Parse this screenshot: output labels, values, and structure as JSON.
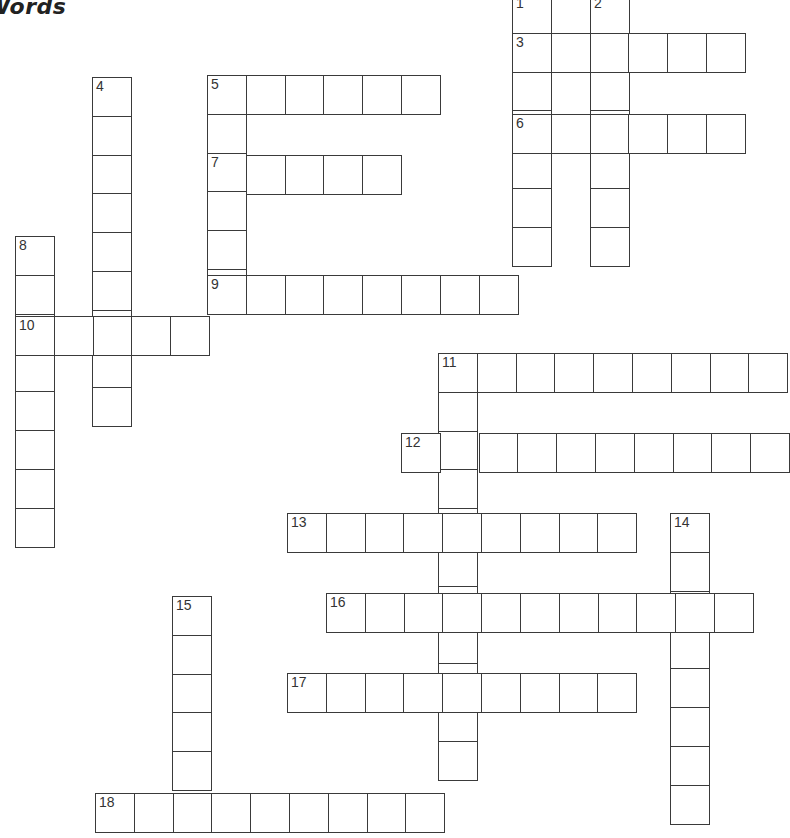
{
  "title": "Words",
  "cell_size": 38.8,
  "colors": {
    "line": "#3a3a3a",
    "background": "#ffffff",
    "number": "#333333"
  },
  "words": [
    {
      "number": 1,
      "direction": "down",
      "x": 512,
      "y": -6,
      "length": 7
    },
    {
      "number": 2,
      "direction": "down",
      "x": 590,
      "y": -6,
      "length": 7
    },
    {
      "number": 3,
      "direction": "across",
      "x": 512,
      "y": 33,
      "length": 6
    },
    {
      "number": 4,
      "direction": "down",
      "x": 92,
      "y": 77,
      "length": 9
    },
    {
      "number": 5,
      "direction": "across",
      "x": 207,
      "y": 75,
      "length": 6
    },
    {
      "number": 5,
      "direction": "down",
      "x": 207,
      "y": 75,
      "length": 6
    },
    {
      "number": 6,
      "direction": "across",
      "x": 512,
      "y": 114,
      "length": 6
    },
    {
      "number": 7,
      "direction": "across",
      "x": 207,
      "y": 155,
      "length": 5
    },
    {
      "number": 8,
      "direction": "down",
      "x": 15,
      "y": 236,
      "length": 8
    },
    {
      "number": 9,
      "direction": "across",
      "x": 207,
      "y": 275,
      "length": 8
    },
    {
      "number": 10,
      "direction": "across",
      "x": 15,
      "y": 316,
      "length": 5
    },
    {
      "number": 11,
      "direction": "across",
      "x": 438,
      "y": 353,
      "length": 9
    },
    {
      "number": 11,
      "direction": "down",
      "x": 438,
      "y": 353,
      "length": 11
    },
    {
      "number": 12,
      "direction": "across",
      "x": 401,
      "y": 433,
      "length": 10
    },
    {
      "number": 13,
      "direction": "across",
      "x": 287,
      "y": 513,
      "length": 9
    },
    {
      "number": 14,
      "direction": "down",
      "x": 670,
      "y": 513,
      "length": 8
    },
    {
      "number": 15,
      "direction": "down",
      "x": 172,
      "y": 596,
      "length": 5
    },
    {
      "number": 16,
      "direction": "across",
      "x": 326,
      "y": 593,
      "length": 11
    },
    {
      "number": 17,
      "direction": "across",
      "x": 287,
      "y": 673,
      "length": 9
    },
    {
      "number": 18,
      "direction": "across",
      "x": 95,
      "y": 793,
      "length": 9
    }
  ]
}
